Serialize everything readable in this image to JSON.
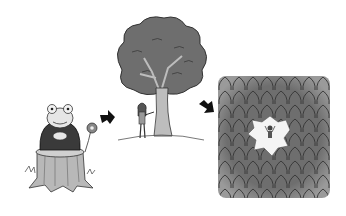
{
  "scene": {
    "description": "Three-step illustrated sequence: frog sitting on tree stump, then a girl beside a large tree, then an overhead view of a small figure in a clearing of a dense forest",
    "panels": [
      {
        "id": "frog-on-stump",
        "label": ""
      },
      {
        "id": "girl-and-tree",
        "label": ""
      },
      {
        "id": "forest-clearing",
        "label": ""
      }
    ],
    "arrows": [
      "arrow-1",
      "arrow-2"
    ]
  },
  "colors": {
    "background": "#ffffff",
    "foliage": "#6e6e6e",
    "foliage_dark": "#4a4a4a",
    "trunk": "#bdbdbd",
    "stump": "#b8b8b8",
    "frog": "#e6e6e6",
    "robe": "#3a3a3a",
    "arrow": "#111111",
    "clearing": "#f4f4f4"
  }
}
